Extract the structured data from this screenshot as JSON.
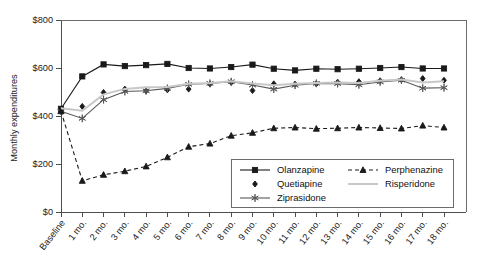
{
  "chart_data": {
    "type": "line",
    "title": "",
    "xlabel": "",
    "ylabel": "Monthly expenditures",
    "ylim": [
      0,
      800
    ],
    "ytick_labels": [
      "$0",
      "$200",
      "$400",
      "$600",
      "$800"
    ],
    "ytick_values": [
      0,
      200,
      400,
      600,
      800
    ],
    "grid": false,
    "legend_position": "inside-lower-right",
    "categories": [
      "Baseline",
      "1 mo.",
      "2 mo.",
      "3 mo.",
      "4 mo.",
      "5 mo.",
      "6 mo.",
      "7 mo.",
      "8 mo.",
      "9 mo.",
      "10 mo.",
      "11 mo.",
      "12 mo.",
      "13 mo.",
      "14 mo.",
      "15 mo.",
      "16 mo.",
      "17 mo.",
      "18 mo."
    ],
    "series": [
      {
        "name": "Olanzapine",
        "color": "#1a1a1a",
        "marker": "square",
        "dash": "solid",
        "values": [
          430,
          565,
          615,
          608,
          612,
          617,
          600,
          598,
          604,
          614,
          597,
          590,
          597,
          595,
          597,
          600,
          604,
          598,
          598
        ]
      },
      {
        "name": "Quetiapine",
        "color": "#1a1a1a",
        "marker": "diamond",
        "dash": "none",
        "values": [
          428,
          440,
          498,
          512,
          505,
          509,
          512,
          533,
          540,
          506,
          534,
          533,
          534,
          541,
          543,
          547,
          551,
          556,
          549
        ]
      },
      {
        "name": "Ziprasidone",
        "color": "#585858",
        "marker": "star",
        "dash": "solid",
        "values": [
          420,
          390,
          468,
          502,
          505,
          515,
          532,
          536,
          543,
          529,
          512,
          528,
          536,
          535,
          530,
          542,
          549,
          516,
          518
        ]
      },
      {
        "name": "Perphenazine",
        "color": "#1a1a1a",
        "marker": "triangle",
        "dash": "dashed",
        "values": [
          420,
          130,
          155,
          170,
          190,
          228,
          272,
          285,
          318,
          330,
          349,
          352,
          347,
          349,
          352,
          350,
          348,
          360,
          352
        ]
      },
      {
        "name": "Risperidone",
        "color": "#c8c8c8",
        "marker": "none",
        "dash": "solid",
        "values": [
          432,
          422,
          490,
          513,
          520,
          521,
          534,
          538,
          545,
          535,
          528,
          534,
          538,
          540,
          538,
          547,
          552,
          540,
          545
        ]
      }
    ]
  },
  "legend": {
    "entries": [
      {
        "label": "Olanzapine"
      },
      {
        "label": "Perphenazine"
      },
      {
        "label": "Quetiapine"
      },
      {
        "label": "Risperidone"
      },
      {
        "label": "Ziprasidone"
      }
    ]
  }
}
